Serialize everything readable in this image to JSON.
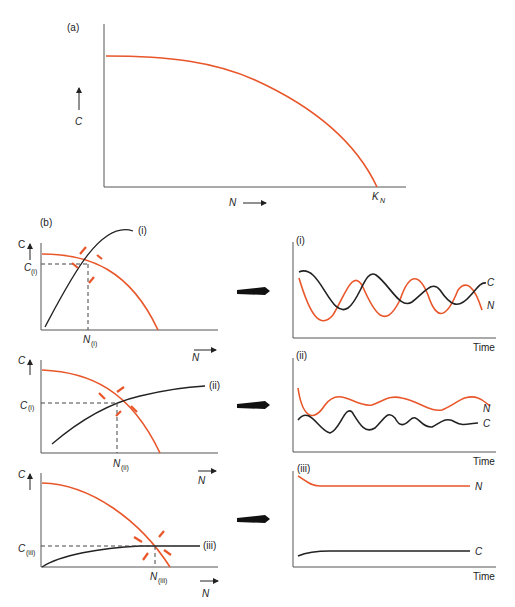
{
  "colors": {
    "orange": "#e8562a",
    "black": "#222222",
    "axis": "#555555",
    "background": "#ffffff"
  },
  "panel_a": {
    "label": "(a)",
    "y_axis_label": "C",
    "x_axis_label": "N",
    "x_end_label": "K",
    "x_end_subscript": "N"
  },
  "panel_b": {
    "label": "(b)",
    "rows": [
      {
        "id": "i",
        "curve_label": "(i)",
        "c_star": "C",
        "c_star_sub": "(i)",
        "n_star": "N",
        "n_star_sub": "(i)",
        "y_axis": "C",
        "x_axis": "N",
        "timeseries": {
          "label": "(i)",
          "n_label": "N",
          "c_label": "C",
          "x_label": "Time"
        }
      },
      {
        "id": "ii",
        "curve_label": "(ii)",
        "c_star": "C",
        "c_star_sub": "(i)",
        "n_star": "N",
        "n_star_sub": "(ii)",
        "y_axis": "C",
        "x_axis": "N",
        "timeseries": {
          "label": "(ii)",
          "n_label": "N",
          "c_label": "C",
          "x_label": "Time"
        }
      },
      {
        "id": "iii",
        "curve_label": "(iii)",
        "c_star": "C",
        "c_star_sub": "(iii)",
        "n_star": "N",
        "n_star_sub": "(iii)",
        "y_axis": "C",
        "x_axis": "N",
        "timeseries": {
          "label": "(iii)",
          "n_label": "N",
          "c_label": "C",
          "x_label": "Time"
        }
      }
    ]
  }
}
